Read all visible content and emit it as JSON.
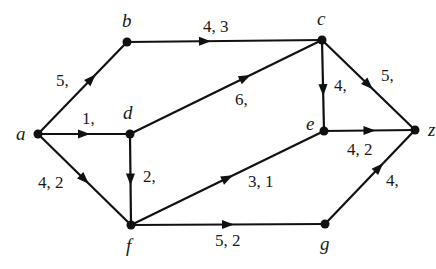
{
  "diagram": {
    "type": "directed-flow-network",
    "colors": {
      "ink": "#111111",
      "background": "#ffffff"
    },
    "nodes": [
      {
        "id": "a",
        "label": "a",
        "x": 38,
        "y": 134,
        "lx": 16,
        "ly": 140
      },
      {
        "id": "b",
        "label": "b",
        "x": 127,
        "y": 42,
        "lx": 122,
        "ly": 27
      },
      {
        "id": "c",
        "label": "c",
        "x": 322,
        "y": 40,
        "lx": 317,
        "ly": 25
      },
      {
        "id": "d",
        "label": "d",
        "x": 130,
        "y": 134,
        "lx": 123,
        "ly": 119
      },
      {
        "id": "e",
        "label": "e",
        "x": 324,
        "y": 131,
        "lx": 306,
        "ly": 130
      },
      {
        "id": "f",
        "label": "f",
        "x": 131,
        "y": 225,
        "lx": 126,
        "ly": 252
      },
      {
        "id": "g",
        "label": "g",
        "x": 325,
        "y": 224,
        "lx": 320,
        "ly": 250
      },
      {
        "id": "z",
        "label": "z",
        "x": 415,
        "y": 130,
        "lx": 428,
        "ly": 136
      }
    ],
    "edges": [
      {
        "from": "a",
        "to": "b",
        "label": "5,",
        "lx": 56,
        "ly": 86,
        "t": 0.6
      },
      {
        "from": "a",
        "to": "d",
        "label": "1,",
        "lx": 82,
        "ly": 124,
        "t": 0.5
      },
      {
        "from": "a",
        "to": "f",
        "label": "4, 2",
        "lx": 38,
        "ly": 188,
        "t": 0.5
      },
      {
        "from": "b",
        "to": "c",
        "label": "4, 3",
        "lx": 203,
        "ly": 32,
        "t": 0.4
      },
      {
        "from": "d",
        "to": "c",
        "label": "6,",
        "lx": 235,
        "ly": 105,
        "t": 0.6
      },
      {
        "from": "d",
        "to": "f",
        "label": "2,",
        "lx": 143,
        "ly": 182,
        "t": 0.5
      },
      {
        "from": "c",
        "to": "e",
        "label": "4,",
        "lx": 334,
        "ly": 91,
        "t": 0.55
      },
      {
        "from": "c",
        "to": "z",
        "label": "5,",
        "lx": 381,
        "ly": 81,
        "t": 0.5
      },
      {
        "from": "e",
        "to": "z",
        "label": "4, 2",
        "lx": 347,
        "ly": 155,
        "t": 0.5
      },
      {
        "from": "f",
        "to": "e",
        "label": "3, 1",
        "lx": 248,
        "ly": 187,
        "t": 0.5
      },
      {
        "from": "f",
        "to": "g",
        "label": "5, 2",
        "lx": 215,
        "ly": 246,
        "t": 0.5
      },
      {
        "from": "g",
        "to": "z",
        "label": "4,",
        "lx": 386,
        "ly": 186,
        "t": 0.6
      }
    ]
  }
}
